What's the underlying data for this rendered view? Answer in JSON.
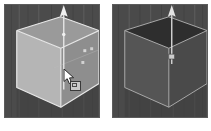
{
  "figure": {
    "title": "3D viewport comparison: cube with Z-axis translate gizmo",
    "panel_count": 2,
    "background_color": "#ffffff"
  },
  "panels": [
    {
      "id": "left",
      "label": "Left viewport",
      "caption": "",
      "state_label": "Cube selected / being dragged",
      "viewport_background": "#4b4b4b",
      "border_color": "#5c5c5c",
      "object": {
        "name": "cube",
        "shape": "cube",
        "face_left_color": "#b5b5b5",
        "face_right_color": "#8e8e8e",
        "face_top_color": "#9a9a9a",
        "outline_color": "#e8e8e8",
        "outline_width": 1.2,
        "selected": true
      },
      "gizmo": {
        "name": "translate-z-gizmo",
        "axis": "Z",
        "color": "#e6e6e6",
        "shaft_x": 60,
        "shaft_top_y": 4,
        "shaft_bottom_y": 86,
        "arrow_head": "cone-up",
        "handle_dot_y": 30
      },
      "handles": [
        {
          "name": "vertex-handle-a",
          "x": 82,
          "y": 47,
          "size": 3,
          "color": "#d8d8d8"
        },
        {
          "name": "vertex-handle-b",
          "x": 88,
          "y": 45,
          "size": 3,
          "color": "#cfcfcf"
        },
        {
          "name": "vertex-handle-c",
          "x": 80,
          "y": 58,
          "size": 3,
          "color": "#d2d2d2"
        }
      ],
      "cursor": {
        "name": "mouse-cursor",
        "type": "arrow-with-drag-badge",
        "x": 58,
        "y": 64,
        "badge": "box-handle"
      }
    },
    {
      "id": "right",
      "label": "Right viewport",
      "caption": "",
      "state_label": "Cube deselected / darkened result",
      "viewport_background": "#4a4a4a",
      "border_color": "#5c5c5c",
      "object": {
        "name": "cube",
        "shape": "cube",
        "face_left_color": "#555555",
        "face_right_color": "#4a4a4a",
        "face_top_color": "#2e2e2e",
        "outline_color": "#a9a9a9",
        "outline_width": 1.0,
        "selected": false
      },
      "gizmo": {
        "name": "translate-z-gizmo",
        "axis": "Z",
        "color": "#d9d9d9",
        "shaft_x": 60,
        "shaft_top_y": 4,
        "shaft_bottom_y": 60,
        "arrow_head": "cone-up",
        "handle_dot_y": 52
      },
      "handles": [],
      "cursor": null
    }
  ]
}
